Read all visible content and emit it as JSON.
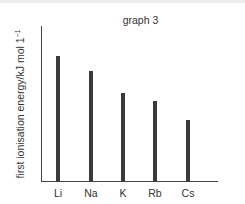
{
  "chart_data": {
    "type": "bar",
    "title": "graph 3",
    "xlabel": "",
    "ylabel": "first ionisation energy/kJ mol 1",
    "ylabel_superscript": "−1",
    "categories": [
      "Li",
      "Na",
      "K",
      "Rb",
      "Cs"
    ],
    "values": [
      81,
      71,
      57,
      52,
      40
    ],
    "value_scale_note": "relative bar height as % of y-axis length (no tick values shown)",
    "ylim": [
      0,
      100
    ],
    "grid": false,
    "legend": null,
    "bar_color": "#3a3a3a",
    "axis_color": "#444444"
  },
  "layout": {
    "bar_positions_px": [
      15,
      48,
      80,
      112,
      145
    ],
    "axis_height_px": 156
  }
}
